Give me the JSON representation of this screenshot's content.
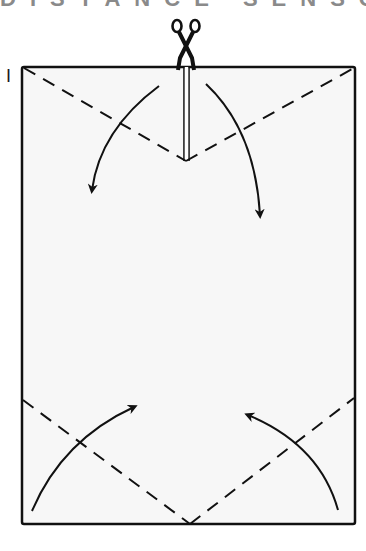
{
  "header": {
    "title_fragment": "DISTANCE SENSOR"
  },
  "diagram": {
    "step_number": "I",
    "colors": {
      "paper": "#f7f7f7",
      "ink": "#111111",
      "title": "#8a8a8a"
    },
    "paper_rect": {
      "x": 22,
      "y": 67,
      "width": 333,
      "height": 457
    },
    "icons": [
      "scissors-icon",
      "fold-arrow-down-left",
      "fold-arrow-down-right",
      "fold-arrow-up-left",
      "fold-arrow-up-right"
    ],
    "fold_lines": [
      {
        "name": "top-left-valley",
        "from": [
          22,
          67
        ],
        "to": [
          186,
          161
        ]
      },
      {
        "name": "top-right-valley",
        "from": [
          186,
          161
        ],
        "to": [
          355,
          67
        ]
      },
      {
        "name": "bottom-left-valley",
        "from": [
          22,
          400
        ],
        "to": [
          190,
          524
        ]
      },
      {
        "name": "bottom-right-valley",
        "from": [
          190,
          524
        ],
        "to": [
          355,
          398
        ]
      }
    ],
    "cut_line": {
      "from": [
        186,
        67
      ],
      "to": [
        186,
        161
      ]
    }
  }
}
